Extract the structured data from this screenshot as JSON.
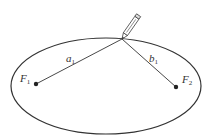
{
  "diagram": {
    "ellipse": {
      "cx": 106,
      "cy": 86,
      "rx": 95,
      "ry": 48,
      "stroke": "#333333"
    },
    "pencil_tip": {
      "x": 122,
      "y": 39
    },
    "foci": [
      {
        "id": "F1",
        "label": "F",
        "subscript": "1",
        "x": 36,
        "y": 84
      },
      {
        "id": "F2",
        "label": "F",
        "subscript": "2",
        "x": 176,
        "y": 87
      }
    ],
    "segments": [
      {
        "id": "a1",
        "label": "a",
        "subscript": "1",
        "from": "F1",
        "to": "pencil_tip"
      },
      {
        "id": "b1",
        "label": "b",
        "subscript": "1",
        "from": "pencil_tip",
        "to": "F2"
      }
    ],
    "icons": {
      "pencil": "pencil-icon"
    }
  }
}
